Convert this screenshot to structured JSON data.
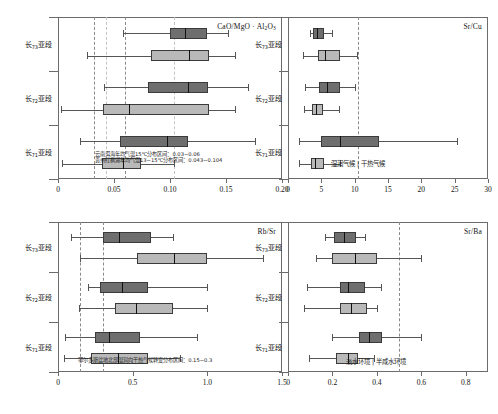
{
  "figure": {
    "kind": "box-plot-grid",
    "panel_count": 4,
    "group_labels": [
      "长7₃亚段",
      "长7₂亚段",
      "长7₁亚段"
    ],
    "series_legend": [
      "dark-series",
      "light-series"
    ],
    "colors": {
      "dark_box": "#6e6e6e",
      "light_box": "#b9b9b9",
      "box_edge": "#3b3b3b",
      "median": "#111111",
      "whisker": "#555555",
      "frame": "#6b6b6b",
      "refline": "#8a8a8a",
      "refline_light": "#c4c4c4"
    }
  },
  "chart_data": [
    {
      "type": "box",
      "id": "panel-cao-mgo-al2o3",
      "title": "CaO/MgO · Al₂O₃",
      "title_plain": "CaO/MgO · Al2O3",
      "xlabel": "",
      "ylabel": "",
      "xlim": [
        0,
        0.2
      ],
      "xticks": [
        0,
        0.05,
        0.1,
        0.15,
        0.2
      ],
      "xticklabels": [
        "0",
        "0.05",
        "0.10",
        "0.15",
        "0.20"
      ],
      "grid": false,
      "legend": "none",
      "reflines": [
        0.032,
        0.043,
        0.06,
        0.104
      ],
      "categories": [
        "长7₃亚段",
        "长7₂亚段",
        "长7₁亚段"
      ],
      "annotations": [
        "云南洱海年均气温15℃分布区间：0.03~0.06",
        "贵州红枫湖年均气温13~15℃分布区间：0.043~0.104"
      ],
      "boxes": [
        {
          "group": "长7₃亚段",
          "series": "dark-series",
          "whisker_low": 0.058,
          "q1": 0.1,
          "median": 0.113,
          "q3": 0.133,
          "whisker_high": 0.152
        },
        {
          "group": "长7₃亚段",
          "series": "light-series",
          "whisker_low": 0.026,
          "q1": 0.083,
          "median": 0.117,
          "q3": 0.135,
          "whisker_high": 0.158
        },
        {
          "group": "长7₂亚段",
          "series": "dark-series",
          "whisker_low": 0.041,
          "q1": 0.08,
          "median": 0.116,
          "q3": 0.134,
          "whisker_high": 0.17
        },
        {
          "group": "长7₂亚段",
          "series": "light-series",
          "whisker_low": 0.003,
          "q1": 0.04,
          "median": 0.063,
          "q3": 0.135,
          "whisker_high": 0.158
        },
        {
          "group": "长7₁亚段",
          "series": "dark-series",
          "whisker_low": 0.02,
          "q1": 0.055,
          "median": 0.097,
          "q3": 0.116,
          "whisker_high": 0.176
        },
        {
          "group": "长7₁亚段",
          "series": "light-series",
          "whisker_low": 0.004,
          "q1": 0.039,
          "median": 0.058,
          "q3": 0.074,
          "whisker_high": 0.104
        }
      ]
    },
    {
      "type": "box",
      "id": "panel-sr-cu",
      "title": "Sr/Cu",
      "title_plain": "Sr/Cu",
      "xlabel": "",
      "ylabel": "",
      "xlim": [
        0,
        30
      ],
      "xticks": [
        0,
        5,
        10,
        15,
        20,
        25,
        30
      ],
      "xticklabels": [
        "0",
        "5",
        "10",
        "15",
        "20",
        "25",
        "30"
      ],
      "grid": false,
      "legend": "none",
      "reflines": [
        10.5
      ],
      "categories": [
        "长7₃亚段",
        "长7₂亚段",
        "长7₁亚段"
      ],
      "annotations": [
        "湿润气候 | 干热气候"
      ],
      "boxes": [
        {
          "group": "长7₃亚段",
          "series": "dark-series",
          "whisker_low": 3.3,
          "q1": 3.8,
          "median": 4.3,
          "q3": 5.4,
          "whisker_high": 6.6
        },
        {
          "group": "长7₃亚段",
          "series": "light-series",
          "whisker_low": 2.2,
          "q1": 4.5,
          "median": 5.6,
          "q3": 7.8,
          "whisker_high": 10.4
        },
        {
          "group": "长7₂亚段",
          "series": "dark-series",
          "whisker_low": 2.6,
          "q1": 4.6,
          "median": 5.9,
          "q3": 7.8,
          "whisker_high": 10.0
        },
        {
          "group": "长7₂亚段",
          "series": "light-series",
          "whisker_low": 2.4,
          "q1": 3.6,
          "median": 4.2,
          "q3": 5.3,
          "whisker_high": 7.6
        },
        {
          "group": "长7₁亚段",
          "series": "dark-series",
          "whisker_low": 1.6,
          "q1": 4.9,
          "median": 7.8,
          "q3": 13.6,
          "whisker_high": 25.3
        },
        {
          "group": "长7₁亚段",
          "series": "light-series",
          "whisker_low": 1.7,
          "q1": 3.5,
          "median": 4.0,
          "q3": 5.4,
          "whisker_high": 7.8
        }
      ]
    },
    {
      "type": "box",
      "id": "panel-rb-sr",
      "title": "Rb/Sr",
      "title_plain": "Rb/Sr",
      "xlabel": "",
      "ylabel": "",
      "xlim": [
        0,
        1.5
      ],
      "xticks": [
        0,
        0.5,
        1.0,
        1.5
      ],
      "xticklabels": [
        "0",
        "0.5",
        "1.0",
        "1.5"
      ],
      "grid": false,
      "legend": "none",
      "reflines": [
        0.15,
        0.3
      ],
      "categories": [
        "长7₃亚段",
        "长7₂亚段",
        "长7₁亚段"
      ],
      "annotations": [
        "鄂尔多斯盆地北部湿润向干热气候转变分布区间：0.15~0.3"
      ],
      "boxes": [
        {
          "group": "长7₃亚段",
          "series": "dark-series",
          "whisker_low": 0.09,
          "q1": 0.3,
          "median": 0.41,
          "q3": 0.62,
          "whisker_high": 0.77
        },
        {
          "group": "长7₃亚段",
          "series": "light-series",
          "whisker_low": 0.15,
          "q1": 0.53,
          "median": 0.78,
          "q3": 1.0,
          "whisker_high": 1.37
        },
        {
          "group": "长7₂亚段",
          "series": "dark-series",
          "whisker_low": 0.2,
          "q1": 0.28,
          "median": 0.43,
          "q3": 0.6,
          "whisker_high": 1.0
        },
        {
          "group": "长7₂亚段",
          "series": "light-series",
          "whisker_low": 0.14,
          "q1": 0.38,
          "median": 0.52,
          "q3": 0.77,
          "whisker_high": 1.0
        },
        {
          "group": "长7₁亚段",
          "series": "dark-series",
          "whisker_low": 0.05,
          "q1": 0.25,
          "median": 0.34,
          "q3": 0.55,
          "whisker_high": 0.93
        },
        {
          "group": "长7₁亚段",
          "series": "light-series",
          "whisker_low": 0.04,
          "q1": 0.22,
          "median": 0.4,
          "q3": 0.6,
          "whisker_high": 0.82
        }
      ]
    },
    {
      "type": "box",
      "id": "panel-sr-ba",
      "title": "Sr/Ba",
      "title_plain": "Sr/Ba",
      "xlabel": "",
      "ylabel": "",
      "xlim": [
        0,
        0.9
      ],
      "xticks": [
        0,
        0.2,
        0.4,
        0.6,
        0.8
      ],
      "xticklabels": [
        "0",
        "0.2",
        "0.4",
        "0.6",
        "0.8"
      ],
      "grid": false,
      "legend": "none",
      "reflines": [
        0.5
      ],
      "categories": [
        "长7₃亚段",
        "长7₂亚段",
        "长7₁亚段"
      ],
      "annotations": [
        "淡水环境 | 半咸水环境"
      ],
      "boxes": [
        {
          "group": "长7₃亚段",
          "series": "dark-series",
          "whisker_low": 0.165,
          "q1": 0.205,
          "median": 0.25,
          "q3": 0.305,
          "whisker_high": 0.345
        },
        {
          "group": "长7₃亚段",
          "series": "light-series",
          "whisker_low": 0.125,
          "q1": 0.2,
          "median": 0.3,
          "q3": 0.4,
          "whisker_high": 0.6
        },
        {
          "group": "长7₂亚段",
          "series": "dark-series",
          "whisker_low": 0.085,
          "q1": 0.235,
          "median": 0.27,
          "q3": 0.345,
          "whisker_high": 0.42
        },
        {
          "group": "长7₂亚段",
          "series": "light-series",
          "whisker_low": 0.07,
          "q1": 0.235,
          "median": 0.285,
          "q3": 0.355,
          "whisker_high": 0.4
        },
        {
          "group": "长7₁亚段",
          "series": "dark-series",
          "whisker_low": 0.2,
          "q1": 0.32,
          "median": 0.365,
          "q3": 0.425,
          "whisker_high": 0.6
        },
        {
          "group": "长7₁亚段",
          "series": "light-series",
          "whisker_low": 0.095,
          "q1": 0.215,
          "median": 0.27,
          "q3": 0.315,
          "whisker_high": 0.385
        }
      ]
    }
  ]
}
